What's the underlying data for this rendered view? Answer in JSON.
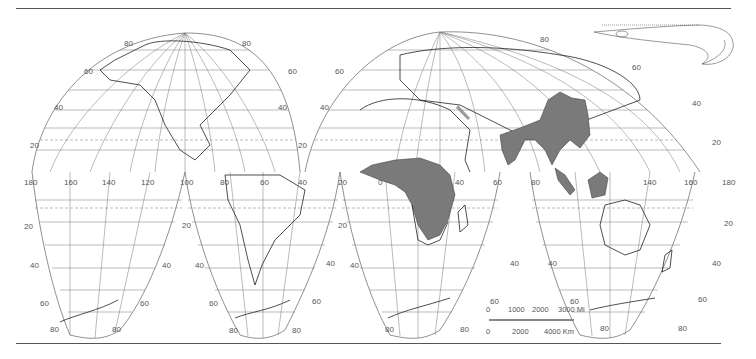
{
  "map": {
    "type": "distribution-map",
    "projection": "interrupted homolosine (Goode)",
    "range_fill_color": "#7a7a7a",
    "line_color": "#333333",
    "range_regions": [
      "Tropical Africa (west & central Africa)",
      "South Asia (India)",
      "Southeast Asia (Indochina, southern China)",
      "Sumatra",
      "Borneo",
      "Java"
    ],
    "illustration": "eel-like fish (dorsal fin along back, curled tail)",
    "latitude_labels": {
      "north": [
        "80",
        "60",
        "40",
        "20"
      ],
      "south": [
        "20",
        "40",
        "60",
        "80"
      ]
    },
    "longitude_labels": [
      "180",
      "160",
      "140",
      "120",
      "100",
      "80",
      "60",
      "40",
      "20",
      "0",
      "20",
      "40",
      "60",
      "80",
      "100",
      "120",
      "140",
      "160",
      "180"
    ]
  },
  "labels": {
    "na_80_left": "80",
    "na_80_right": "80",
    "na_60_left": "60",
    "na_60_right": "60",
    "na_40_left": "40",
    "na_40_right": "40",
    "na_20_left": "20",
    "na_20_right": "20",
    "eu_80": "80",
    "eu_80_right": "80",
    "eu_60_left": "60",
    "eu_60_right": "60",
    "eu_40_left": "40",
    "eu_40_right": "40",
    "eu_20_left": "20",
    "eu_20_right": "20",
    "lon_180_left": "180",
    "lon_160": "160",
    "lon_140": "140",
    "lon_120": "120",
    "lon_100": "100",
    "lon_80": "80",
    "lon_60": "60",
    "lon_40": "40",
    "lon_20": "20",
    "lon_0": "0",
    "lon_e20": "20",
    "lon_e40": "40",
    "lon_e60": "60",
    "lon_e80": "80",
    "lon_e120": "120",
    "lon_e140": "140",
    "lon_e160": "160",
    "lon_e180": "180",
    "s1_20_left": "20",
    "s1_20_right": "20",
    "s1_40_left": "40",
    "s1_40_right": "40",
    "s1_60_left": "60",
    "s1_60_right": "60",
    "s1_80_left": "80",
    "s1_80_right": "80",
    "s2_20_left": "20",
    "s2_40_left": "40",
    "s2_40_right": "40",
    "s2_60_left": "60",
    "s2_60_right": "60",
    "s2_80_left": "80",
    "s2_80_right": "80",
    "s3_20_left": "20",
    "s3_40_left": "40",
    "s3_40_right": "40",
    "s3_60_right": "60",
    "s3_80_left": "80",
    "s3_80_right": "80",
    "s4_20_right": "20",
    "s4_40_left": "40",
    "s4_40_right": "40",
    "s4_60_left": "60",
    "s4_60_right": "60",
    "s4_80_left": "80",
    "s4_80_right": "80"
  },
  "scale_bar": {
    "miles": [
      "0",
      "1000",
      "2000",
      "3000 Mi"
    ],
    "kilometers": [
      "0",
      "2000",
      "4000 Km"
    ]
  }
}
